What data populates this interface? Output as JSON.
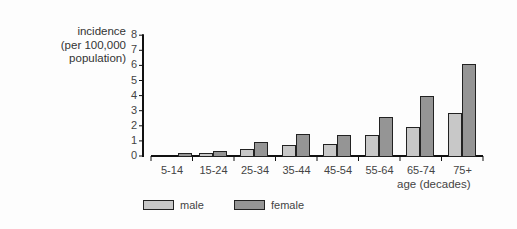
{
  "chart_data": {
    "type": "bar",
    "title": "",
    "ylabel": "incidence (per 100,000 population)",
    "ylabel_lines": [
      "incidence",
      "(per 100,000",
      "population)"
    ],
    "xlabel": "age (decades)",
    "ylim": [
      0,
      8
    ],
    "yticks": [
      0,
      1,
      2,
      3,
      4,
      5,
      6,
      7,
      8
    ],
    "grid": false,
    "legend_position": "bottom",
    "categories": [
      "5-14",
      "15-24",
      "25-34",
      "35-44",
      "45-54",
      "55-64",
      "65-74",
      "75+"
    ],
    "series": [
      {
        "name": "male",
        "color": "#c8c8c8",
        "values": [
          0,
          0.1,
          0.45,
          0.7,
          0.8,
          1.4,
          1.9,
          2.85
        ]
      },
      {
        "name": "female",
        "color": "#959595",
        "values": [
          0.1,
          0.35,
          0.95,
          1.45,
          1.4,
          2.6,
          4.0,
          6.1
        ]
      }
    ]
  }
}
